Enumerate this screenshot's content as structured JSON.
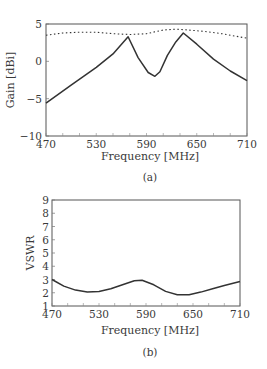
{
  "chart_data": [
    {
      "id": "a",
      "type": "line",
      "caption": "(a)",
      "xlabel": "Frequency [MHz]",
      "ylabel": "Gain [dBi]",
      "xlim": [
        470,
        710
      ],
      "ylim": [
        -10,
        5
      ],
      "xticks": [
        470,
        530,
        590,
        650,
        710
      ],
      "yticks": [
        5,
        0,
        -5,
        -10
      ],
      "grid": false,
      "legend": null,
      "series": [
        {
          "name": "solid",
          "style": "solid",
          "x": [
            470,
            500,
            530,
            550,
            568,
            580,
            592,
            600,
            606,
            615,
            625,
            634,
            650,
            670,
            690,
            710
          ],
          "y": [
            -5.6,
            -3.2,
            -0.8,
            1.0,
            3.3,
            0.5,
            -1.5,
            -2.0,
            -1.4,
            0.8,
            2.6,
            3.8,
            2.3,
            0.3,
            -1.3,
            -2.6
          ]
        },
        {
          "name": "dotted",
          "style": "dotted",
          "x": [
            470,
            490,
            510,
            530,
            550,
            570,
            590,
            610,
            625,
            640,
            660,
            680,
            700,
            710
          ],
          "y": [
            3.5,
            3.8,
            3.9,
            3.9,
            3.7,
            3.6,
            3.7,
            4.2,
            4.3,
            4.2,
            4.0,
            3.7,
            3.3,
            3.1
          ]
        }
      ]
    },
    {
      "id": "b",
      "type": "line",
      "caption": "(b)",
      "xlabel": "Frequency [MHz]",
      "ylabel": "VSWR",
      "xlim": [
        470,
        710
      ],
      "ylim": [
        1,
        9
      ],
      "xticks": [
        470,
        530,
        590,
        650,
        710
      ],
      "yticks": [
        9,
        8,
        7,
        6,
        5,
        4,
        3,
        2,
        1
      ],
      "grid": false,
      "legend": null,
      "series": [
        {
          "name": "VSWR",
          "style": "solid",
          "x": [
            470,
            485,
            500,
            515,
            530,
            545,
            560,
            575,
            585,
            600,
            615,
            630,
            645,
            660,
            675,
            690,
            710
          ],
          "y": [
            3.0,
            2.5,
            2.2,
            2.05,
            2.1,
            2.3,
            2.6,
            2.9,
            2.95,
            2.6,
            2.1,
            1.85,
            1.85,
            2.05,
            2.3,
            2.55,
            2.85
          ]
        }
      ]
    }
  ]
}
